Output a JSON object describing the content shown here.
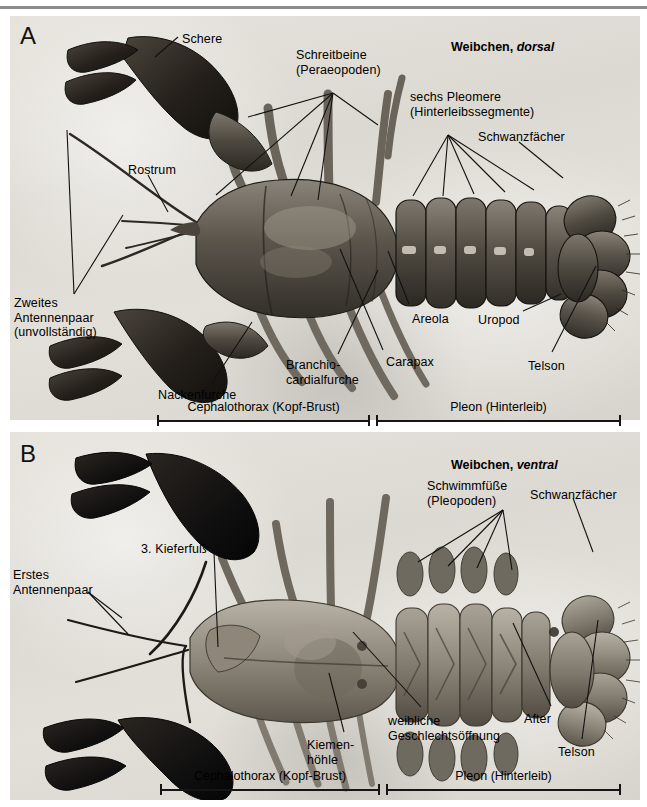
{
  "figure": {
    "width": 647,
    "height": 807,
    "background": "#ffffff",
    "rule_color": "#8c8c8c"
  },
  "panels": [
    {
      "id": "A",
      "letter": "A",
      "header_plain": "Weibchen, ",
      "header_italic": "dorsal",
      "view": "dorsal"
    },
    {
      "id": "B",
      "letter": "B",
      "header_plain": "Weibchen, ",
      "header_italic": "ventral",
      "view": "ventral"
    }
  ],
  "labels_a": [
    {
      "key": "schere",
      "text": "Schere",
      "x": 182,
      "y": 32,
      "align": "left"
    },
    {
      "key": "schreitbeine",
      "text": "Schreitbeine\n(Peraeopoden)",
      "x": 296,
      "y": 48,
      "align": "left"
    },
    {
      "key": "pleomere",
      "text": "sechs Pleomere\n(Hinterleibssegmente)",
      "x": 410,
      "y": 90,
      "align": "left"
    },
    {
      "key": "schwanzfaecher",
      "text": "Schwanzfächer",
      "x": 478,
      "y": 130,
      "align": "left"
    },
    {
      "key": "rostrum",
      "text": "Rostrum",
      "x": 128,
      "y": 163,
      "align": "left"
    },
    {
      "key": "antennenpaar2",
      "text": "Zweites\nAntennenpaar\n(unvollständig)",
      "x": 14,
      "y": 296,
      "align": "left"
    },
    {
      "key": "areola",
      "text": "Areola",
      "x": 412,
      "y": 312,
      "align": "left"
    },
    {
      "key": "uropod",
      "text": "Uropod",
      "x": 478,
      "y": 313,
      "align": "left"
    },
    {
      "key": "carapax",
      "text": "Carapax",
      "x": 386,
      "y": 355,
      "align": "left"
    },
    {
      "key": "branchio",
      "text": "Branchio-\ncardialfurche",
      "x": 286,
      "y": 358,
      "align": "left"
    },
    {
      "key": "telson",
      "text": "Telson",
      "x": 528,
      "y": 359,
      "align": "left"
    },
    {
      "key": "nackenfurche",
      "text": "Nackenfurche",
      "x": 158,
      "y": 388,
      "align": "left"
    }
  ],
  "labels_b": [
    {
      "key": "schwimmfuesse",
      "text": "Schwimmfüße\n(Pleopoden)",
      "x": 427,
      "y": 479,
      "align": "left"
    },
    {
      "key": "schwanzfaecher",
      "text": "Schwanzfächer",
      "x": 530,
      "y": 488,
      "align": "left"
    },
    {
      "key": "kieferfuss3",
      "text": "3. Kieferfuß",
      "x": 141,
      "y": 542,
      "align": "left"
    },
    {
      "key": "antennenpaar1",
      "text": "Erstes\nAntennenpaar",
      "x": 13,
      "y": 568,
      "align": "left"
    },
    {
      "key": "after",
      "text": "After",
      "x": 524,
      "y": 712,
      "align": "left"
    },
    {
      "key": "geschlecht",
      "text": "weibliche\nGeschlechtsöffnung",
      "x": 388,
      "y": 714,
      "align": "left"
    },
    {
      "key": "kiemenhoehle",
      "text": "Kiemen-\nhöhle",
      "x": 307,
      "y": 738,
      "align": "left"
    },
    {
      "key": "telson",
      "text": "Telson",
      "x": 558,
      "y": 745,
      "align": "left"
    }
  ],
  "leaders_a": [
    {
      "name": "schere",
      "points": "178,37 155,57"
    },
    {
      "name": "schreitbeine-1",
      "points": "333,93 248,117"
    },
    {
      "name": "schreitbeine-2",
      "points": "333,93 216,195"
    },
    {
      "name": "schreitbeine-3",
      "points": "333,93 291,196"
    },
    {
      "name": "schreitbeine-4",
      "points": "333,93 318,200"
    },
    {
      "name": "schreitbeine-5",
      "points": "333,93 378,125"
    },
    {
      "name": "pleomere-1",
      "points": "448,135 413,196"
    },
    {
      "name": "pleomere-2",
      "points": "448,135 443,196"
    },
    {
      "name": "pleomere-3",
      "points": "448,135 474,194"
    },
    {
      "name": "pleomere-4",
      "points": "448,135 505,192"
    },
    {
      "name": "pleomere-5",
      "points": "448,135 534,190"
    },
    {
      "name": "schwanzfaecher",
      "points": "519,142 563,178"
    },
    {
      "name": "rostrum",
      "points": "148,175 168,212"
    },
    {
      "name": "antennenpaar2-a",
      "points": "74,294 67,130"
    },
    {
      "name": "antennenpaar2-b",
      "points": "74,294 123,215"
    },
    {
      "name": "areola",
      "points": "409,304 388,251"
    },
    {
      "name": "uropod",
      "points": "523,311 561,294"
    },
    {
      "name": "carapax",
      "points": "383,350 340,249"
    },
    {
      "name": "branchio",
      "points": "338,354 378,270"
    },
    {
      "name": "telson",
      "points": "552,352 596,266"
    },
    {
      "name": "nackenfurche",
      "points": "212,383 252,322"
    }
  ],
  "leaders_b": [
    {
      "name": "schwimmfuesse-1",
      "points": "503,510 418,562"
    },
    {
      "name": "schwimmfuesse-2",
      "points": "503,510 448,566"
    },
    {
      "name": "schwimmfuesse-3",
      "points": "503,510 477,568"
    },
    {
      "name": "schwimmfuesse-4",
      "points": "503,510 512,570"
    },
    {
      "name": "schwanzfaecher",
      "points": "573,498 593,552"
    },
    {
      "name": "kieferfuss3",
      "points": "214,552 218,647"
    },
    {
      "name": "antennenpaar1-a",
      "points": "88,592 122,618"
    },
    {
      "name": "antennenpaar1-b",
      "points": "88,592 128,634"
    },
    {
      "name": "after",
      "points": "551,706 513,623"
    },
    {
      "name": "geschlecht",
      "points": "421,707 353,632"
    },
    {
      "name": "kiemenhoehle",
      "points": "344,732 329,673"
    },
    {
      "name": "telson",
      "points": "582,739 598,620"
    }
  ],
  "extent_bars": [
    {
      "panel": "A",
      "y": 420,
      "segments": [
        {
          "label": "Cephalothorax (Kopf-Brust)",
          "x1": 157,
          "x2": 370,
          "label_y": 400
        },
        {
          "label": "Pleon (Hinterleib)",
          "x1": 376,
          "x2": 621,
          "label_y": 400
        }
      ]
    },
    {
      "panel": "B",
      "y": 789,
      "segments": [
        {
          "label": "Cephalothorax (Kopf-Brust)",
          "x1": 160,
          "x2": 380,
          "label_y": 769
        },
        {
          "label": "Pleon (Hinterleib)",
          "x1": 386,
          "x2": 621,
          "label_y": 769
        }
      ]
    }
  ],
  "headers": {
    "a": {
      "x": 437,
      "y": 26
    },
    "b": {
      "x": 437,
      "y": 444
    }
  },
  "letters": {
    "a": {
      "x": 20,
      "y": 22
    },
    "b": {
      "x": 20,
      "y": 440
    }
  },
  "colors": {
    "ink": "#000000",
    "leader": "#111111",
    "paper": "#e3e0d9",
    "shell_dark": "#3a352f",
    "shell_mid": "#6b655c",
    "shell_light": "#b4aea3",
    "claw": "#16140f"
  }
}
